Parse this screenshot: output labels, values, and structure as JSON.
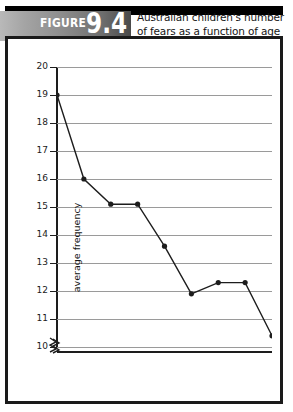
{
  "figure": {
    "badge_word": "FIGURE",
    "badge_number": "9.4",
    "title": "Australian children's number of fears as a function of age"
  },
  "chart_data": {
    "type": "line",
    "title": "Australian children's number of fears as a function of age",
    "xlabel": "age in years",
    "ylabel": "average frequency",
    "x": [
      8,
      9,
      10,
      11,
      12,
      13,
      14,
      15,
      16
    ],
    "categories": [
      "8",
      "9",
      "10",
      "11",
      "12",
      "13",
      "14",
      "15",
      "16"
    ],
    "values": [
      19.0,
      16.0,
      15.1,
      15.1,
      13.6,
      11.9,
      12.3,
      12.3,
      10.4
    ],
    "series": [
      {
        "name": "average frequency",
        "values": [
          19.0,
          16.0,
          15.1,
          15.1,
          13.6,
          11.9,
          12.3,
          12.3,
          10.4
        ]
      }
    ],
    "xlim": [
      8,
      16
    ],
    "ylim": [
      10,
      20
    ],
    "ytick_labels": [
      "10",
      "11",
      "12",
      "13",
      "14",
      "15",
      "16",
      "17",
      "18",
      "19",
      "20"
    ],
    "xtick_labels": [
      "8",
      "9",
      "10",
      "11",
      "12",
      "13",
      "14",
      "15",
      "16"
    ],
    "grid": "horizontal",
    "legend": "none",
    "y_axis_break": true,
    "marker": "filled-circle",
    "line_color": "#1d1d1d",
    "grid_color": "#9a9a9a"
  }
}
